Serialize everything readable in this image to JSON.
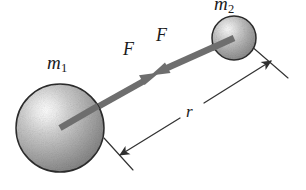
{
  "figure": {
    "name": "newton-law-universal-gravitation-diagram",
    "background_color": "#ffffff",
    "width": 306,
    "height": 190,
    "bodies": [
      {
        "id": "m1",
        "label": "m",
        "subscript": "1",
        "role": "large-mass-sphere",
        "center_x": 60,
        "center_y": 128,
        "radius": 44,
        "highlight_x": 46,
        "highlight_y": 111,
        "fill_light": "#f2f2f2",
        "fill_mid": "#a8a8a8",
        "fill_dark": "#7d7d7d",
        "outline_color": "#2b2b2b"
      },
      {
        "id": "m2",
        "label": "m",
        "subscript": "2",
        "role": "small-mass-sphere",
        "center_x": 234,
        "center_y": 38,
        "radius": 22,
        "highlight_x": 227,
        "highlight_y": 30,
        "fill_light": "#efefef",
        "fill_mid": "#a5a5a5",
        "fill_dark": "#7b7b7b",
        "outline_color": "#2b2b2b"
      }
    ],
    "force_vectors": [
      {
        "id": "force-on-m1",
        "label": "F",
        "description": "force arrow from m1 center pointing toward m2",
        "from_x": 60,
        "from_y": 128,
        "to_x": 157,
        "to_y": 74,
        "color": "#6e6e6e",
        "shaft_width": 6,
        "label_x": 123,
        "label_y": 40
      },
      {
        "id": "force-on-m2",
        "label": "F",
        "description": "force arrow from m2 center pointing toward m1",
        "from_x": 234,
        "from_y": 38,
        "to_x": 152,
        "to_y": 74,
        "color": "#6e6e6e",
        "shaft_width": 6,
        "label_x": 156,
        "label_y": 26
      }
    ],
    "distance_dimension": {
      "id": "separation-r",
      "label": "r",
      "description": "double-headed dimension line measuring centre separation r",
      "from_x": 118,
      "from_y": 156,
      "to_x": 273,
      "to_y": 60,
      "break_start_x": 180,
      "break_start_y": 118,
      "break_end_x": 204,
      "break_end_y": 103,
      "color": "#333333",
      "line_width": 1.3,
      "label_x": 186,
      "label_y": 103,
      "witness_lines": [
        {
          "id": "witness-left",
          "x1": 104,
          "y1": 138,
          "x2": 133,
          "y2": 170
        },
        {
          "id": "witness-right",
          "x1": 250,
          "y1": 45,
          "x2": 288,
          "y2": 78
        }
      ]
    }
  }
}
